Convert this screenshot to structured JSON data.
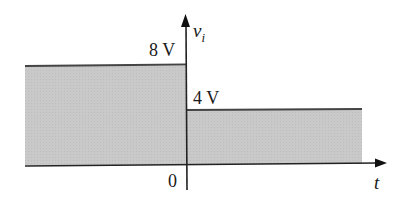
{
  "figure": {
    "y_axis_label": "v",
    "y_axis_subscript": "i",
    "x_axis_label": "t",
    "origin_label": "0",
    "level_high_label": "8 V",
    "level_low_label": "4 V",
    "fill_color": "#c8c8c8",
    "line_color": "#333333"
  },
  "waveform": {
    "segments": [
      {
        "t_range": "t < 0",
        "value_V": 8
      },
      {
        "t_range": "t > 0",
        "value_V": 4
      }
    ]
  }
}
